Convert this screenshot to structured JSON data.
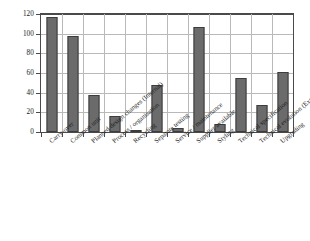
{
  "chart_data": {
    "type": "bar",
    "title": "",
    "subtitle": "",
    "xlabel": "",
    "ylabel": "",
    "ylim": [
      0,
      120
    ],
    "yticks": [
      0,
      20,
      40,
      60,
      80,
      100,
      120
    ],
    "ytick_labels": [
      "0",
      "20",
      "40",
      "60",
      "80",
      "100",
      "120"
    ],
    "grid": true,
    "legend": false,
    "bar_color": "#6b6b6b",
    "bar_edge_color": "#3d3d3d",
    "categories": [
      "Carry-over",
      "Common unit",
      "Planned design changes (Internal)",
      "Process / organisation",
      "Recycling",
      "Separate testing",
      "Service / maintenance",
      "Supplier available",
      "Styling",
      "Technical specification",
      "Technical evolution (External)",
      "Upgrading"
    ],
    "values": [
      117,
      98,
      38,
      16,
      1,
      48,
      4,
      107,
      8,
      55,
      27,
      61
    ]
  }
}
